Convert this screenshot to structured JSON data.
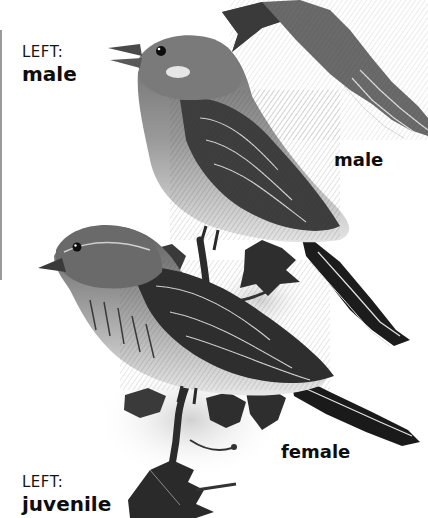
{
  "labels": {
    "top_left": {
      "kicker": "LEFT:",
      "name": "male"
    },
    "bottom_left": {
      "kicker": "LEFT:",
      "name": "juvenile"
    }
  },
  "captions": {
    "right_male": "male",
    "right_female": "female"
  },
  "illustration": {
    "subjects": [
      "flying-bird-partial",
      "male-bird-perched",
      "female-bird-perched",
      "branch-with-leaves"
    ],
    "palette": {
      "ink": "#111111",
      "mid": "#6e6e6e",
      "light": "#c8c8c8",
      "paper": "#ffffff"
    }
  }
}
